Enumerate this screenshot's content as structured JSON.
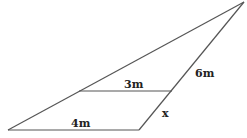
{
  "diagram": {
    "type": "similar-triangles",
    "labels": {
      "bottom_side": "4m",
      "middle_parallel": "3m",
      "right_upper_segment": "6m",
      "right_lower_segment": "x"
    },
    "colors": {
      "line": "#555555",
      "text": "#222222",
      "background": "#ffffff"
    }
  }
}
